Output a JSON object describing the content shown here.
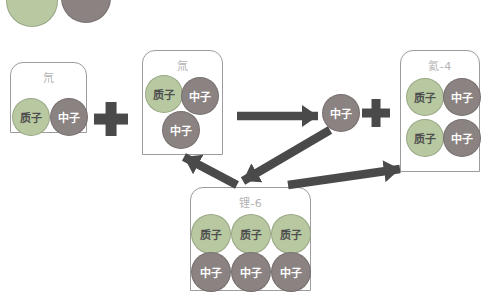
{
  "colors": {
    "proton": "#b8c9a2",
    "neutron": "#8b8282",
    "arrow": "#4a4a4a",
    "box_border": "#9c9c9c",
    "box_label": "#b3b3b3",
    "proton_text": "#4f4f4f",
    "neutron_text": "#ffffff",
    "background": "#ffffff"
  },
  "particles": {
    "proton": "质子",
    "neutron": "中子"
  },
  "boxes": {
    "deuterium": {
      "label": "氘",
      "particles": [
        "质子",
        "中子"
      ]
    },
    "tritium": {
      "label": "氚",
      "particles": [
        "质子",
        "中子",
        "中子"
      ]
    },
    "helium4": {
      "label": "氦-4",
      "particles": [
        "质子",
        "中子",
        "质子",
        "中子"
      ]
    },
    "lithium6": {
      "label": "锂-6",
      "particles": [
        "质子",
        "质子",
        "质子",
        "中子",
        "中子",
        "中子"
      ]
    }
  },
  "free_neutron": {
    "label": "中子"
  },
  "operators": {
    "plus_left": "+",
    "plus_right": "+"
  },
  "icons": {
    "plus": "plus-cross",
    "arrows": [
      "tritium-to-neutron-arrow",
      "neutron-to-lithium-arrow",
      "lithium-to-tritium-arrow",
      "lithium-to-helium-arrow"
    ]
  }
}
